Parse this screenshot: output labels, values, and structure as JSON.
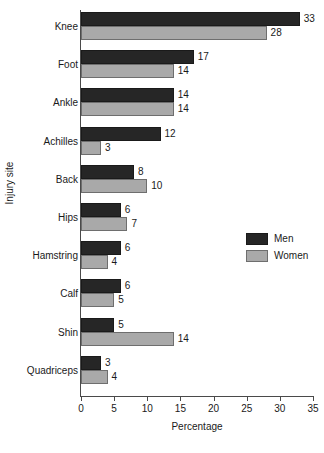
{
  "chart_data": {
    "type": "bar",
    "orientation": "horizontal",
    "title": "",
    "xlabel": "Percentage",
    "ylabel": "Injury site",
    "xlim": [
      0,
      35
    ],
    "xticks": [
      0,
      5,
      10,
      15,
      20,
      25,
      30,
      35
    ],
    "grid": false,
    "legend_position": "middle-right",
    "categories": [
      "Knee",
      "Foot",
      "Ankle",
      "Achilles",
      "Back",
      "Hips",
      "Hamstring",
      "Calf",
      "Shin",
      "Quadriceps"
    ],
    "series": [
      {
        "name": "Men",
        "color": "#262626",
        "values": [
          33,
          17,
          14,
          12,
          8,
          6,
          6,
          6,
          5,
          3
        ]
      },
      {
        "name": "Women",
        "color": "#a9a9a9",
        "values": [
          28,
          14,
          14,
          3,
          10,
          7,
          4,
          5,
          14,
          4
        ]
      }
    ]
  }
}
